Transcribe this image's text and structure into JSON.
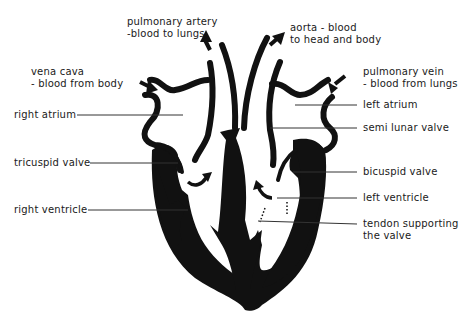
{
  "diagram": {
    "colors": {
      "ink": "#111111",
      "background": "#ffffff",
      "leader_line": "#333333"
    },
    "labels": {
      "pulmonary_artery": {
        "line1": "pulmonary artery",
        "line2": "-blood to lungs"
      },
      "aorta": {
        "line1": "aorta - blood",
        "line2": "to head and body"
      },
      "vena_cava": {
        "line1": "vena cava",
        "line2": "- blood from body"
      },
      "pulmonary_vein": {
        "line1": "pulmonary vein",
        "line2": "- blood from lungs"
      },
      "right_atrium": "right atrium",
      "left_atrium": "left atrium",
      "semi_lunar_valve": "semi lunar valve",
      "tricuspid_valve": "tricuspid valve",
      "bicuspid_valve": "bicuspid valve",
      "left_ventricle": "left ventricle",
      "right_ventricle": "right ventricle",
      "tendon": {
        "line1": "tendon supporting",
        "line2": "the valve"
      }
    },
    "arrows": [
      "arrow-vena-cava-in",
      "arrow-pulmonary-artery-out",
      "arrow-aorta-out",
      "arrow-pulmonary-vein-in",
      "arrow-right-atrium-to-ventricle",
      "arrow-left-atrium-to-ventricle"
    ]
  }
}
